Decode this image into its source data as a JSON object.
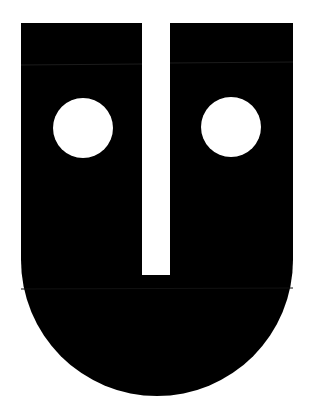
{
  "figure": {
    "colors": {
      "background": "#ffffff",
      "shape": "#000000",
      "eyes": "#ffffff",
      "seam": "#1a1a1a"
    },
    "shape": {
      "left": 21,
      "right": 293,
      "top": 23,
      "arc_start_y": 260,
      "bottom": 396
    },
    "slit": {
      "x": 142,
      "width": 28,
      "top": 23,
      "bottom": 275
    },
    "eyes": [
      {
        "name": "left-eye",
        "cx": 83,
        "cy": 128,
        "r": 30
      },
      {
        "name": "right-eye",
        "cx": 231,
        "cy": 127,
        "r": 30
      }
    ]
  }
}
